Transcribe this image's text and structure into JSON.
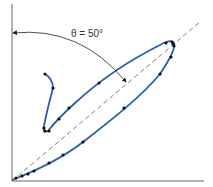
{
  "chart_data": {
    "type": "line",
    "title": "",
    "xlabel": "",
    "ylabel": "",
    "grid": false,
    "annotation": {
      "text": "θ = 50°",
      "angle_deg": 50,
      "description": "arc from vertical axis to dashed 45-degree reference line indicating loop orientation angle"
    },
    "reference_line": {
      "style": "dashed",
      "slope": 1,
      "label": ""
    },
    "series": [
      {
        "name": "hysteresis-loop",
        "color": "#2a5db0",
        "points_px": [
          [
            12,
            180
          ],
          [
            16,
            178
          ],
          [
            22,
            176
          ],
          [
            28,
            174
          ],
          [
            34,
            171
          ],
          [
            49,
            163
          ],
          [
            63,
            155
          ],
          [
            83,
            142
          ],
          [
            124,
            108
          ],
          [
            160,
            74
          ],
          [
            170,
            57
          ],
          [
            174,
            46
          ],
          [
            174,
            43
          ],
          [
            171,
            42
          ],
          [
            165,
            43
          ],
          [
            100,
            82
          ],
          [
            69,
            109
          ],
          [
            59,
            119
          ],
          [
            48,
            131
          ],
          [
            45,
            131
          ],
          [
            43,
            128
          ],
          [
            53,
            88
          ],
          [
            45,
            74
          ]
        ]
      }
    ]
  },
  "colors": {
    "curve": "#2a5db0",
    "axis": "#555555",
    "dashed": "#777777",
    "points": "#111111"
  }
}
